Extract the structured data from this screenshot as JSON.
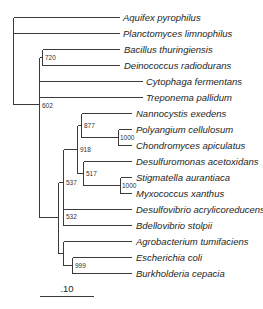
{
  "figure": {
    "type": "phylogenetic-tree",
    "line_color": "#3a3a3a",
    "text_color": "#1e1e1e"
  },
  "taxa": [
    {
      "name": "Aquifex pyrophilus",
      "y": 17,
      "x0": 13,
      "x1": 119,
      "label_x": 123
    },
    {
      "name": "Planctomyces limnophilus",
      "y": 33,
      "x0": 13,
      "x1": 119,
      "label_x": 123
    },
    {
      "name": "Bacillus thuringiensis",
      "y": 49,
      "x0": 42,
      "x1": 119,
      "label_x": 124
    },
    {
      "name": "Deinococcus radiodurans",
      "y": 65,
      "x0": 42,
      "x1": 119,
      "label_x": 124
    },
    {
      "name": "Cytophaga fermentans",
      "y": 81,
      "x0": 39,
      "x1": 142,
      "label_x": 146
    },
    {
      "name": "Treponema pallidum",
      "y": 97,
      "x0": 39,
      "x1": 142,
      "label_x": 146
    },
    {
      "name": "Nannocystis exedens",
      "y": 113,
      "x0": 81,
      "x1": 131,
      "label_x": 136
    },
    {
      "name": "Polyangium cellulosum",
      "y": 129,
      "x0": 118,
      "x1": 131,
      "label_x": 136
    },
    {
      "name": "Chondromyces apiculatus",
      "y": 145,
      "x0": 118,
      "x1": 131,
      "label_x": 136
    },
    {
      "name": "Desulfuromonas acetoxidans",
      "y": 161,
      "x0": 83,
      "x1": 131,
      "label_x": 136
    },
    {
      "name": "Stigmatella aurantiaca",
      "y": 177,
      "x0": 120,
      "x1": 131,
      "label_x": 136
    },
    {
      "name": "Myxococcus xanthus",
      "y": 193,
      "x0": 120,
      "x1": 131,
      "label_x": 136
    },
    {
      "name": "Desulfovibrio acrylicoreducens",
      "y": 209,
      "x0": 63,
      "x1": 131,
      "label_x": 136
    },
    {
      "name": "Bdellovibrio stolpii",
      "y": 225,
      "x0": 63,
      "x1": 131,
      "label_x": 136
    },
    {
      "name": "Agrobacterium tumifaciens",
      "y": 241,
      "x0": 63,
      "x1": 131,
      "label_x": 136
    },
    {
      "name": "Escherichia coli",
      "y": 257,
      "x0": 72,
      "x1": 131,
      "label_x": 136
    },
    {
      "name": "Burkholderia cepacia",
      "y": 273,
      "x0": 72,
      "x1": 131,
      "label_x": 136
    }
  ],
  "internal_branches": [
    {
      "id": "root-vertical",
      "x1": 13,
      "y1": 17,
      "x2": 13,
      "y2": 104
    },
    {
      "id": "root-to-602",
      "x1": 13,
      "y1": 104,
      "x2": 39,
      "y2": 104
    },
    {
      "id": "node-602-vertical",
      "x1": 39,
      "y1": 57,
      "x2": 39,
      "y2": 217
    },
    {
      "id": "to-720",
      "x1": 39,
      "y1": 57,
      "x2": 42,
      "y2": 57
    },
    {
      "id": "node-720-vertical",
      "x1": 42,
      "y1": 49,
      "x2": 42,
      "y2": 65
    },
    {
      "id": "to-proteo",
      "x1": 39,
      "y1": 217,
      "x2": 58,
      "y2": 217
    },
    {
      "id": "proteo-vertical",
      "x1": 58,
      "y1": 182,
      "x2": 58,
      "y2": 253
    },
    {
      "id": "to-537",
      "x1": 58,
      "y1": 182,
      "x2": 63,
      "y2": 182
    },
    {
      "id": "node-537-vertical",
      "x1": 63,
      "y1": 149,
      "x2": 63,
      "y2": 217
    },
    {
      "id": "to-918",
      "x1": 63,
      "y1": 149,
      "x2": 77,
      "y2": 149
    },
    {
      "id": "node-918-vertical",
      "x1": 77,
      "y1": 125,
      "x2": 77,
      "y2": 173
    },
    {
      "id": "to-877",
      "x1": 77,
      "y1": 125,
      "x2": 81,
      "y2": 125
    },
    {
      "id": "node-877-vertical",
      "x1": 81,
      "y1": 113,
      "x2": 81,
      "y2": 137
    },
    {
      "id": "to-1000a",
      "x1": 81,
      "y1": 137,
      "x2": 118,
      "y2": 137
    },
    {
      "id": "node-1000a-vertical",
      "x1": 118,
      "y1": 129,
      "x2": 118,
      "y2": 145
    },
    {
      "id": "to-517",
      "x1": 77,
      "y1": 173,
      "x2": 83,
      "y2": 173
    },
    {
      "id": "node-517-vertical",
      "x1": 83,
      "y1": 161,
      "x2": 83,
      "y2": 185
    },
    {
      "id": "to-1000b",
      "x1": 83,
      "y1": 185,
      "x2": 120,
      "y2": 185
    },
    {
      "id": "node-1000b-vertical",
      "x1": 120,
      "y1": 177,
      "x2": 120,
      "y2": 193
    },
    {
      "id": "to-532",
      "x1": 63,
      "y1": 217,
      "x2": 63,
      "y2": 217
    },
    {
      "id": "node-532-vertical",
      "x1": 63,
      "y1": 209,
      "x2": 63,
      "y2": 225
    },
    {
      "id": "to-alpha-beta",
      "x1": 58,
      "y1": 253,
      "x2": 63,
      "y2": 253
    },
    {
      "id": "alpha-beta-vertical",
      "x1": 63,
      "y1": 241,
      "x2": 63,
      "y2": 265
    },
    {
      "id": "to-999",
      "x1": 63,
      "y1": 265,
      "x2": 72,
      "y2": 265
    },
    {
      "id": "node-999-vertical",
      "x1": 72,
      "y1": 257,
      "x2": 72,
      "y2": 273
    }
  ],
  "bootstrap_values": [
    {
      "value": "720",
      "x": 45,
      "y": 60
    },
    {
      "value": "602",
      "x": 42,
      "y": 108
    },
    {
      "value": "877",
      "x": 84,
      "y": 128
    },
    {
      "value": "1000",
      "x": 120,
      "y": 140
    },
    {
      "value": "918",
      "x": 80,
      "y": 152
    },
    {
      "value": "517",
      "x": 86,
      "y": 176
    },
    {
      "value": "1000",
      "x": 122,
      "y": 188
    },
    {
      "value": "537",
      "x": 66,
      "y": 185
    },
    {
      "value": "532",
      "x": 66,
      "y": 219
    },
    {
      "value": "999",
      "x": 75,
      "y": 268
    }
  ],
  "scale_bar": {
    "label": ".10",
    "x1": 40,
    "x2": 94,
    "y": 296,
    "label_x": 67,
    "label_y": 292
  }
}
